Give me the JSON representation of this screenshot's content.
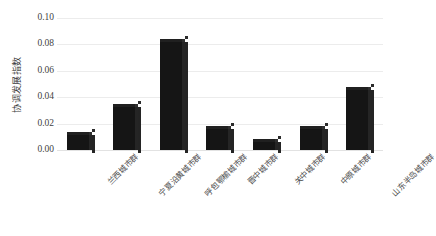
{
  "chart_data": {
    "type": "bar",
    "title": "",
    "subtitle": "",
    "xlabel": "",
    "ylabel": "协调发展指数",
    "ylim": [
      0.0,
      0.1
    ],
    "yticks": [
      "0.00",
      "0.02",
      "0.04",
      "0.06",
      "0.08",
      "0.10"
    ],
    "ytick_values": [
      0.0,
      0.02,
      0.04,
      0.06,
      0.08,
      0.1
    ],
    "grid": true,
    "legend": "none",
    "categories": [
      "兰西城市群",
      "宁夏沿黄城市群",
      "呼包鄂榆城市群",
      "晋中城市群",
      "关中城市群",
      "中原城市群",
      "山东半岛城市群"
    ],
    "values": [
      0.014,
      0.035,
      0.084,
      0.018,
      0.008,
      0.018,
      0.048
    ],
    "bar_color": "#151515",
    "gridline_color": "#ececec",
    "background_color": "#ffffff"
  },
  "caption": {
    "text": ""
  }
}
